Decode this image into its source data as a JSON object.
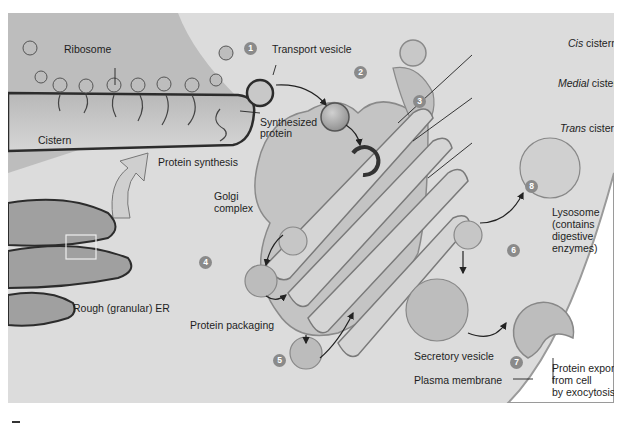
{
  "figure": {
    "labels": {
      "ribosome": "Ribosome",
      "transport_vesicle": "Transport vesicle",
      "synthesized_protein_1": "Synthesized",
      "synthesized_protein_2": "protein",
      "cistern": "Cistern",
      "protein_synthesis": "Protein synthesis",
      "golgi_1": "Golgi",
      "golgi_2": "complex",
      "rough_er": "Rough (granular) ER",
      "protein_packaging": "Protein packaging",
      "cis_italic": "Cis",
      "cis_rest": " cistern",
      "medial_italic": "Medial",
      "medial_rest": " cistern",
      "trans_italic": "Trans",
      "trans_rest": " cistern",
      "lysosome_1": "Lysosome",
      "lysosome_2": "(contains",
      "lysosome_3": "digestive",
      "lysosome_4": "enzymes)",
      "secretory_vesicle": "Secretory vesicle",
      "plasma_membrane": "Plasma membrane",
      "export_1": "Protein export",
      "export_2": "from cell",
      "export_3": "by exocytosis"
    },
    "steps": [
      "1",
      "2",
      "3",
      "4",
      "5",
      "6",
      "7",
      "8"
    ],
    "colors": {
      "background": "#dcdcdc",
      "cytoplasm": "#d2d2d2",
      "membrane": "#3a3a3a",
      "golgi_fill": "#c4c4c4",
      "vesicle_fill": "#a8a8a8",
      "step_badge": "#8a8a8a"
    }
  }
}
